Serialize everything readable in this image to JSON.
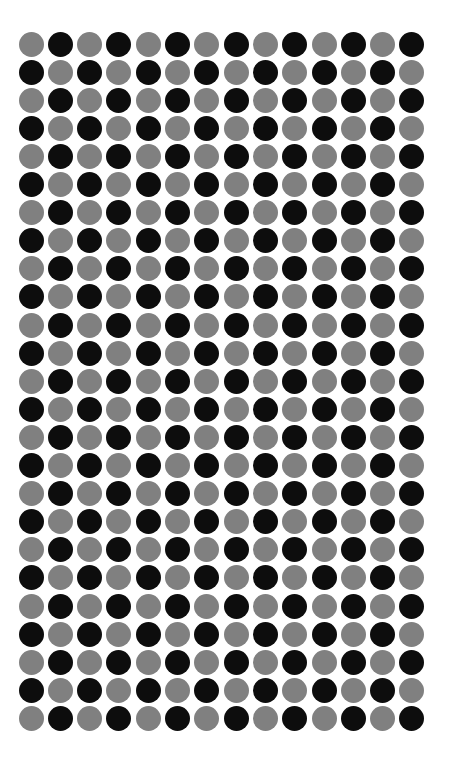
{
  "canvas": {
    "width": 456,
    "height": 764,
    "background": "#ffffff"
  },
  "pattern": {
    "type": "checkerboard-dot-grid",
    "columns": 14,
    "rows": 25,
    "dot_diameter": 25,
    "column_spacing": 29.3,
    "row_spacing": 28.1,
    "origin_x": 31,
    "origin_y": 44,
    "colors": {
      "light": "#808080",
      "dark": "#0d0d0d"
    },
    "parity_rule": "light when (row + column) is even, dark when odd",
    "first_dot_color": "light"
  },
  "chart_data": {
    "type": "heatmap",
    "title": "",
    "xlabel": "",
    "ylabel": "",
    "legend": [
      {
        "label": "light",
        "color": "#808080",
        "value": 0
      },
      {
        "label": "dark",
        "color": "#0d0d0d",
        "value": 1
      }
    ],
    "columns": 14,
    "rows": 25,
    "values": [
      [
        0,
        1,
        0,
        1,
        0,
        1,
        0,
        1,
        0,
        1,
        0,
        1,
        0,
        1
      ],
      [
        1,
        0,
        1,
        0,
        1,
        0,
        1,
        0,
        1,
        0,
        1,
        0,
        1,
        0
      ],
      [
        0,
        1,
        0,
        1,
        0,
        1,
        0,
        1,
        0,
        1,
        0,
        1,
        0,
        1
      ],
      [
        1,
        0,
        1,
        0,
        1,
        0,
        1,
        0,
        1,
        0,
        1,
        0,
        1,
        0
      ],
      [
        0,
        1,
        0,
        1,
        0,
        1,
        0,
        1,
        0,
        1,
        0,
        1,
        0,
        1
      ],
      [
        1,
        0,
        1,
        0,
        1,
        0,
        1,
        0,
        1,
        0,
        1,
        0,
        1,
        0
      ],
      [
        0,
        1,
        0,
        1,
        0,
        1,
        0,
        1,
        0,
        1,
        0,
        1,
        0,
        1
      ],
      [
        1,
        0,
        1,
        0,
        1,
        0,
        1,
        0,
        1,
        0,
        1,
        0,
        1,
        0
      ],
      [
        0,
        1,
        0,
        1,
        0,
        1,
        0,
        1,
        0,
        1,
        0,
        1,
        0,
        1
      ],
      [
        1,
        0,
        1,
        0,
        1,
        0,
        1,
        0,
        1,
        0,
        1,
        0,
        1,
        0
      ],
      [
        0,
        1,
        0,
        1,
        0,
        1,
        0,
        1,
        0,
        1,
        0,
        1,
        0,
        1
      ],
      [
        1,
        0,
        1,
        0,
        1,
        0,
        1,
        0,
        1,
        0,
        1,
        0,
        1,
        0
      ],
      [
        0,
        1,
        0,
        1,
        0,
        1,
        0,
        1,
        0,
        1,
        0,
        1,
        0,
        1
      ],
      [
        1,
        0,
        1,
        0,
        1,
        0,
        1,
        0,
        1,
        0,
        1,
        0,
        1,
        0
      ],
      [
        0,
        1,
        0,
        1,
        0,
        1,
        0,
        1,
        0,
        1,
        0,
        1,
        0,
        1
      ],
      [
        1,
        0,
        1,
        0,
        1,
        0,
        1,
        0,
        1,
        0,
        1,
        0,
        1,
        0
      ],
      [
        0,
        1,
        0,
        1,
        0,
        1,
        0,
        1,
        0,
        1,
        0,
        1,
        0,
        1
      ],
      [
        1,
        0,
        1,
        0,
        1,
        0,
        1,
        0,
        1,
        0,
        1,
        0,
        1,
        0
      ],
      [
        0,
        1,
        0,
        1,
        0,
        1,
        0,
        1,
        0,
        1,
        0,
        1,
        0,
        1
      ],
      [
        1,
        0,
        1,
        0,
        1,
        0,
        1,
        0,
        1,
        0,
        1,
        0,
        1,
        0
      ],
      [
        0,
        1,
        0,
        1,
        0,
        1,
        0,
        1,
        0,
        1,
        0,
        1,
        0,
        1
      ],
      [
        1,
        0,
        1,
        0,
        1,
        0,
        1,
        0,
        1,
        0,
        1,
        0,
        1,
        0
      ],
      [
        0,
        1,
        0,
        1,
        0,
        1,
        0,
        1,
        0,
        1,
        0,
        1,
        0,
        1
      ],
      [
        1,
        0,
        1,
        0,
        1,
        0,
        1,
        0,
        1,
        0,
        1,
        0,
        1,
        0
      ],
      [
        0,
        1,
        0,
        1,
        0,
        1,
        0,
        1,
        0,
        1,
        0,
        1,
        0,
        1
      ]
    ]
  }
}
